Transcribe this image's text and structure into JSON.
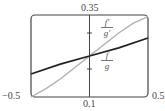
{
  "chart_data": {
    "type": "line",
    "title": "",
    "xlabel": "",
    "ylabel": "",
    "xlim": [
      -0.5,
      0.5
    ],
    "ylim": [
      0.1,
      0.35
    ],
    "tick_labels": {
      "x_min": "−0.5",
      "x_max": "0.5",
      "y_min": "0.1",
      "y_max": "0.35"
    },
    "grid": false,
    "series": [
      {
        "name": "f/g",
        "label_num": "f",
        "label_den": "g",
        "color": "#222222",
        "x": [
          -0.5,
          -0.25,
          0,
          0.25,
          0.5
        ],
        "y": [
          0.17,
          0.2,
          0.225,
          0.25,
          0.28
        ]
      },
      {
        "name": "f'/g'",
        "label_num": "f′",
        "label_den": "g′",
        "color": "#b0b0b0",
        "x": [
          -0.5,
          -0.375,
          -0.25,
          -0.125,
          0,
          0.125,
          0.25,
          0.375,
          0.5
        ],
        "y": [
          0.1,
          0.125,
          0.155,
          0.19,
          0.225,
          0.26,
          0.295,
          0.325,
          0.345
        ]
      }
    ]
  }
}
